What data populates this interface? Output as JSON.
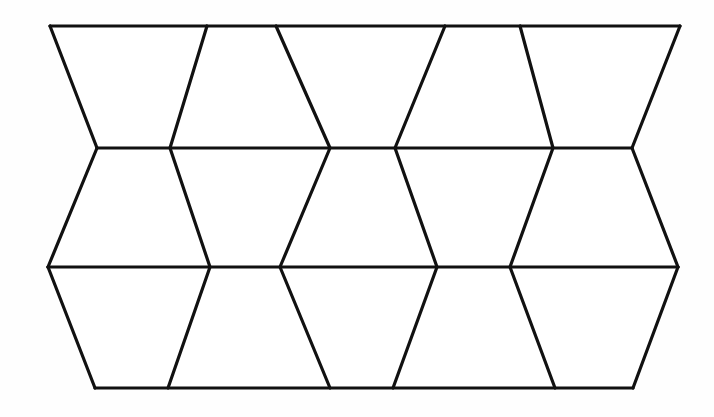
{
  "figure": {
    "background_color": "#fefefe",
    "line_color": "#111111",
    "face_color": "#ffffff",
    "line_width": 3.2,
    "canvas": {
      "width": 714,
      "height": 417
    }
  },
  "geometry": {
    "rails": [
      {
        "name": "top-rail",
        "y": 26,
        "x_start": 50,
        "x_end": 680
      },
      {
        "name": "upper-middle-rail",
        "y": 148,
        "x_start": 97,
        "x_end": 632
      },
      {
        "name": "lower-middle-rail",
        "y": 267,
        "x_start": 48,
        "x_end": 678
      },
      {
        "name": "bottom-rail",
        "y": 388,
        "x_start": 95,
        "x_end": 633
      }
    ],
    "rail_vertices": {
      "top": [
        50,
        207,
        276,
        445,
        520,
        680
      ],
      "upper_middle": [
        97,
        170,
        330,
        395,
        553,
        632
      ],
      "lower_middle": [
        48,
        210,
        280,
        437,
        510,
        678
      ],
      "bottom": [
        95,
        168,
        330,
        393,
        555,
        633
      ]
    },
    "slant_edges": [
      {
        "band": 1,
        "x1": 50,
        "y1": 26,
        "x2": 97,
        "y2": 148
      },
      {
        "band": 1,
        "x1": 207,
        "y1": 26,
        "x2": 170,
        "y2": 148
      },
      {
        "band": 1,
        "x1": 276,
        "y1": 26,
        "x2": 330,
        "y2": 148
      },
      {
        "band": 1,
        "x1": 445,
        "y1": 26,
        "x2": 395,
        "y2": 148
      },
      {
        "band": 1,
        "x1": 520,
        "y1": 26,
        "x2": 553,
        "y2": 148
      },
      {
        "band": 1,
        "x1": 680,
        "y1": 26,
        "x2": 632,
        "y2": 148
      },
      {
        "band": 2,
        "x1": 97,
        "y1": 148,
        "x2": 48,
        "y2": 267
      },
      {
        "band": 2,
        "x1": 170,
        "y1": 148,
        "x2": 210,
        "y2": 267
      },
      {
        "band": 2,
        "x1": 330,
        "y1": 148,
        "x2": 280,
        "y2": 267
      },
      {
        "band": 2,
        "x1": 395,
        "y1": 148,
        "x2": 437,
        "y2": 267
      },
      {
        "band": 2,
        "x1": 553,
        "y1": 148,
        "x2": 510,
        "y2": 267
      },
      {
        "band": 2,
        "x1": 632,
        "y1": 148,
        "x2": 678,
        "y2": 267
      },
      {
        "band": 3,
        "x1": 48,
        "y1": 267,
        "x2": 95,
        "y2": 388
      },
      {
        "band": 3,
        "x1": 210,
        "y1": 267,
        "x2": 168,
        "y2": 388
      },
      {
        "band": 3,
        "x1": 280,
        "y1": 267,
        "x2": 330,
        "y2": 388
      },
      {
        "band": 3,
        "x1": 437,
        "y1": 267,
        "x2": 393,
        "y2": 388
      },
      {
        "band": 3,
        "x1": 510,
        "y1": 267,
        "x2": 555,
        "y2": 388
      },
      {
        "band": 3,
        "x1": 678,
        "y1": 267,
        "x2": 633,
        "y2": 388
      }
    ],
    "faces": [
      {
        "band": 1,
        "index": 1,
        "orientation": "wide-top",
        "points": "50,26 207,26 170,148 97,148"
      },
      {
        "band": 1,
        "index": 2,
        "orientation": "narrow-top",
        "points": "207,26 276,26 330,148 170,148"
      },
      {
        "band": 1,
        "index": 3,
        "orientation": "wide-top",
        "points": "276,26 445,26 395,148 330,148"
      },
      {
        "band": 1,
        "index": 4,
        "orientation": "narrow-top",
        "points": "445,26 520,26 553,148 395,148"
      },
      {
        "band": 1,
        "index": 5,
        "orientation": "wide-top",
        "points": "520,26 680,26 632,148 553,148"
      },
      {
        "band": 2,
        "index": 1,
        "orientation": "narrow-top",
        "points": "97,148 170,148 210,267 48,267"
      },
      {
        "band": 2,
        "index": 2,
        "orientation": "wide-top",
        "points": "170,148 330,148 280,267 210,267"
      },
      {
        "band": 2,
        "index": 3,
        "orientation": "narrow-top",
        "points": "330,148 395,148 437,267 280,267"
      },
      {
        "band": 2,
        "index": 4,
        "orientation": "wide-top",
        "points": "395,148 553,148 510,267 437,267"
      },
      {
        "band": 2,
        "index": 5,
        "orientation": "narrow-top",
        "points": "553,148 632,148 678,267 510,267"
      },
      {
        "band": 3,
        "index": 1,
        "orientation": "wide-top",
        "points": "48,267 210,267 168,388 95,388"
      },
      {
        "band": 3,
        "index": 2,
        "orientation": "narrow-top",
        "points": "210,267 280,267 330,388 168,388"
      },
      {
        "band": 3,
        "index": 3,
        "orientation": "wide-top",
        "points": "280,267 437,267 393,388 330,388"
      },
      {
        "band": 3,
        "index": 4,
        "orientation": "narrow-top",
        "points": "437,267 510,267 555,388 393,388"
      },
      {
        "band": 3,
        "index": 5,
        "orientation": "wide-top",
        "points": "510,267 678,267 633,388 555,388"
      }
    ],
    "counts": {
      "bands": 3,
      "trapezoids_per_band": 5,
      "total_trapezoids": 15,
      "horizontal_rails": 4,
      "slant_edges": 18
    }
  }
}
